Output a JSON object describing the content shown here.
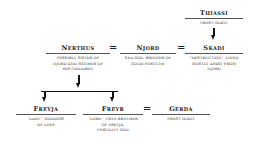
{
  "diagram": {
    "type": "family-tree",
    "nodes": {
      "thiassi": {
        "name": "Thiassi",
        "desc": [
          "Frost Giant"
        ]
      },
      "nerthus": {
        "name": "Nerthus",
        "desc": [
          "Possibly sister of",
          "Njord and mother of",
          "his children"
        ]
      },
      "njord": {
        "name": "Njord",
        "desc": [
          "Sea god, bringer of",
          "good fortune"
        ]
      },
      "skadi": {
        "name": "Skadi",
        "desc": [
          "\"Destruction\", lived",
          "mostly apart from",
          "Njord"
        ]
      },
      "freyja": {
        "name": "Freyja",
        "desc": [
          "\"Lady\", goddess",
          "of love"
        ]
      },
      "freyr": {
        "name": "Freyr",
        "desc": [
          "\"Lord\", twin brother",
          "of Freyja,",
          "fertility god"
        ]
      },
      "gerda": {
        "name": "Gerda",
        "desc": [
          "Frost Giant"
        ]
      }
    },
    "symbols": {
      "marriage": "="
    },
    "relations": [
      {
        "type": "parent",
        "from": "Thiassi",
        "to": "Skadi"
      },
      {
        "type": "marriage",
        "a": "Nerthus",
        "b": "Njord"
      },
      {
        "type": "marriage",
        "a": "Njord",
        "b": "Skadi"
      },
      {
        "type": "parent",
        "from": "Nerthus",
        "to": "Freyja"
      },
      {
        "type": "parent",
        "from": "Nerthus",
        "to": "Freyr"
      },
      {
        "type": "marriage",
        "a": "Freyr",
        "b": "Gerda"
      }
    ]
  }
}
